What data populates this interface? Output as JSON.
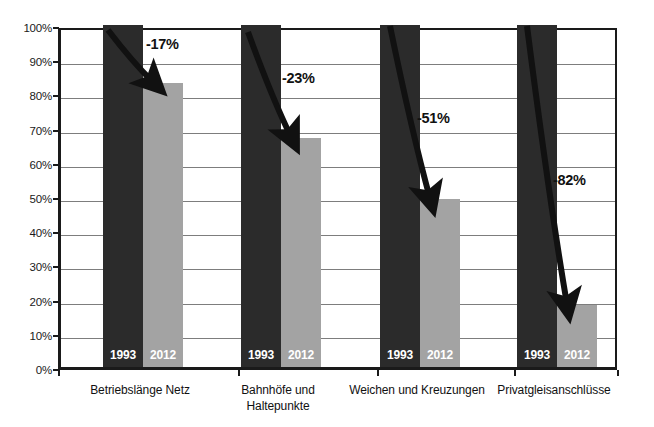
{
  "chart_data": {
    "type": "bar",
    "title": "",
    "subtitle": "",
    "xlabel": "",
    "ylabel": "",
    "ylim": [
      0,
      100
    ],
    "ytick_labels": [
      "0%",
      "10%",
      "20%",
      "30%",
      "40%",
      "50%",
      "60%",
      "70%",
      "80%",
      "90%",
      "100%"
    ],
    "ytick_values": [
      0,
      10,
      20,
      30,
      40,
      50,
      60,
      70,
      80,
      90,
      100
    ],
    "grid": true,
    "legend": null,
    "categories": [
      "Betriebslänge Netz",
      "Bahnhöfe und Haltepunkte",
      "Weichen und Kreuzungen",
      "Privatgleisanschlüsse"
    ],
    "series": [
      {
        "name": "1993",
        "values": [
          100,
          100,
          100,
          100
        ]
      },
      {
        "name": "2012",
        "values": [
          83,
          67,
          49,
          18
        ]
      }
    ],
    "annotations": [
      "-17%",
      "-23%",
      "-51%",
      "-82%"
    ]
  },
  "axis": {
    "y_ticks": [
      {
        "label": "100%",
        "value": 100
      },
      {
        "label": "90%",
        "value": 90
      },
      {
        "label": "80%",
        "value": 80
      },
      {
        "label": "70%",
        "value": 70
      },
      {
        "label": "60%",
        "value": 60
      },
      {
        "label": "50%",
        "value": 50
      },
      {
        "label": "40%",
        "value": 40
      },
      {
        "label": "30%",
        "value": 30
      },
      {
        "label": "20%",
        "value": 20
      },
      {
        "label": "10%",
        "value": 10
      },
      {
        "label": "0%",
        "value": 0
      }
    ]
  },
  "groups": [
    {
      "category": "Betriebslänge Netz",
      "category_line1": "Betriebslänge Netz",
      "category_line2": "",
      "bar_1993_label": "1993",
      "bar_1993_value": 100,
      "bar_2012_label": "2012",
      "bar_2012_value": 83,
      "change": "-17%"
    },
    {
      "category": "Bahnhöfe und Haltepunkte",
      "category_line1": "Bahnhöfe und",
      "category_line2": "Haltepunkte",
      "bar_1993_label": "1993",
      "bar_1993_value": 100,
      "bar_2012_label": "2012",
      "bar_2012_value": 67,
      "change": "-23%"
    },
    {
      "category": "Weichen und Kreuzungen",
      "category_line1": "Weichen und Kreuzungen",
      "category_line2": "",
      "bar_1993_label": "1993",
      "bar_1993_value": 100,
      "bar_2012_label": "2012",
      "bar_2012_value": 49,
      "change": "-51%"
    },
    {
      "category": "Privatgleisanschlüsse",
      "category_line1": "Privatgleisanschlüsse",
      "category_line2": "",
      "bar_1993_label": "1993",
      "bar_1993_value": 100,
      "bar_2012_label": "2012",
      "bar_2012_value": 18,
      "change": "-82%"
    }
  ],
  "colors": {
    "bar_1993": "#2b2b2b",
    "bar_2012": "#a3a3a3",
    "axis": "#1a1a1a",
    "grid": "#7d7d7d",
    "arrow": "#111111",
    "text": "#111111",
    "background": "#ffffff"
  }
}
